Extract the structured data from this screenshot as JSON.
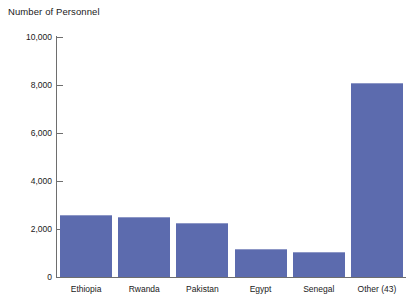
{
  "chart_data": {
    "type": "bar",
    "title": "Number of Personnel",
    "xlabel": "",
    "ylabel": "",
    "ylim": [
      0,
      10000
    ],
    "yticks": [
      0,
      2000,
      4000,
      6000,
      8000,
      10000
    ],
    "ytick_labels": [
      "0",
      "2,000",
      "4,000",
      "6,000",
      "8,000",
      "10,000"
    ],
    "grid": false,
    "legend": false,
    "bar_color": "#5c6bae",
    "categories": [
      "Ethiopia",
      "Rwanda",
      "Pakistan",
      "Egypt",
      "Senegal",
      "Other (43)"
    ],
    "values": [
      2600,
      2500,
      2250,
      1150,
      1050,
      8100
    ]
  }
}
